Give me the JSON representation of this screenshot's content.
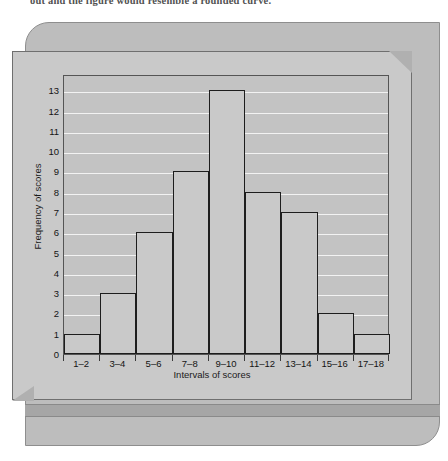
{
  "caption": {
    "text": "out and the figure would resemble a rounded curve."
  },
  "colors": {
    "panel": "#c9c9c9",
    "backplate": "#bdbdbd",
    "plot_background": "#c3c3c3",
    "gridline": "#f2f2f2",
    "bar_fill": "#c9c9c9",
    "bar_outline": "#1d1d1d",
    "axis": "#555555",
    "text": "#141414"
  },
  "chart_data": {
    "type": "bar",
    "title": "",
    "xlabel": "Intervals of scores",
    "ylabel": "Frequency of scores",
    "categories": [
      "1–2",
      "3–4",
      "5–6",
      "7–8",
      "9–10",
      "11–12",
      "13–14",
      "15–16",
      "17–18"
    ],
    "values": [
      1,
      3,
      6,
      9,
      13,
      8,
      7,
      2,
      1
    ],
    "ylim": [
      0,
      13.8
    ],
    "yticks": [
      0,
      1,
      2,
      3,
      4,
      5,
      6,
      7,
      8,
      9,
      10,
      11,
      12,
      13
    ],
    "ytick_labels": [
      "0",
      "1",
      "2",
      "3",
      "4",
      "5",
      "6",
      "7",
      "8",
      "9",
      "10",
      "11",
      "12",
      "13"
    ],
    "grid": true,
    "grid_axis": "y",
    "legend": false,
    "legend_position": "none",
    "bar_gap": 0
  }
}
